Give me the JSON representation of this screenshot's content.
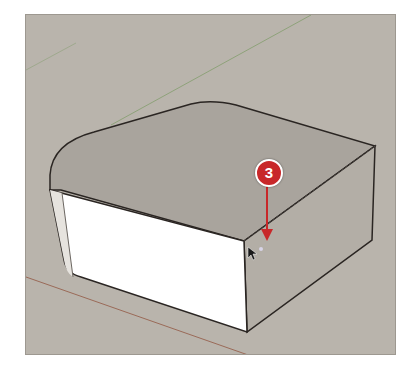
{
  "viewport": {
    "background": "#b9b4ac",
    "axes": {
      "green_axis_color": "#8ea27a",
      "red_axis_color": "#9a6a58"
    },
    "model": {
      "top_face_color": "#a9a49d",
      "front_face_color": "#ffffff",
      "side_face_color": "#b3aea6",
      "edge_color": "#2a2522"
    }
  },
  "callout": {
    "number": "3",
    "color": "#c8282a",
    "icon": "arrow-down-icon"
  },
  "cursor": {
    "icon": "mouse-pointer-icon"
  }
}
